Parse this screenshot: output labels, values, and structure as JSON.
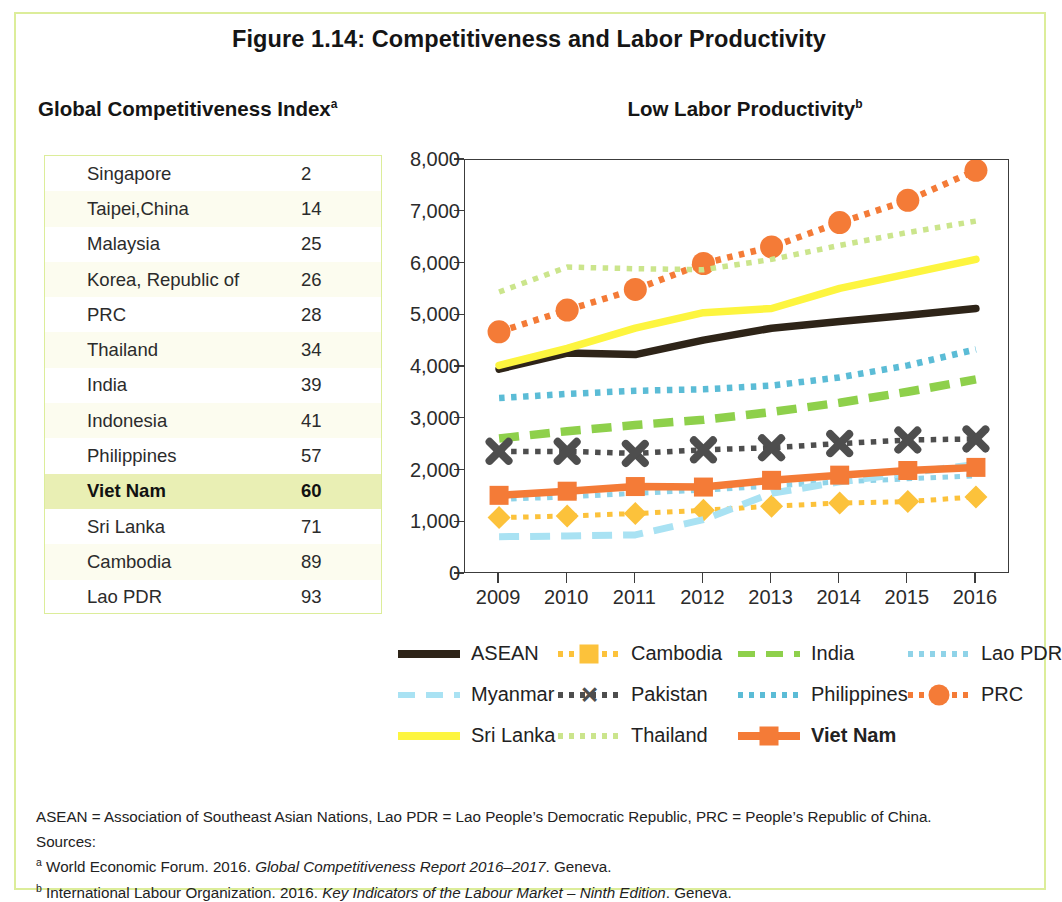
{
  "figure": {
    "title": "Figure 1.14:  Competitiveness and Labor Productivity",
    "left_panel_title": "Global Competitiveness Index",
    "left_panel_super": "a",
    "right_panel_title": "Low Labor Productivity",
    "right_panel_super": "b"
  },
  "gci_table": {
    "rows": [
      {
        "name": "Singapore",
        "rank": "2",
        "highlight": false
      },
      {
        "name": "Taipei,China",
        "rank": "14",
        "highlight": false
      },
      {
        "name": "Malaysia",
        "rank": "25",
        "highlight": false
      },
      {
        "name": "Korea, Republic of",
        "rank": "26",
        "highlight": false
      },
      {
        "name": "PRC",
        "rank": "28",
        "highlight": false
      },
      {
        "name": "Thailand",
        "rank": "34",
        "highlight": false
      },
      {
        "name": "India",
        "rank": "39",
        "highlight": false
      },
      {
        "name": "Indonesia",
        "rank": "41",
        "highlight": false
      },
      {
        "name": "Philippines",
        "rank": "57",
        "highlight": false
      },
      {
        "name": "Viet Nam",
        "rank": "60",
        "highlight": true
      },
      {
        "name": "Sri Lanka",
        "rank": "71",
        "highlight": false
      },
      {
        "name": "Cambodia",
        "rank": "89",
        "highlight": false
      },
      {
        "name": "Lao PDR",
        "rank": "93",
        "highlight": false
      }
    ]
  },
  "legend": {
    "rows": [
      [
        {
          "label": "ASEAN",
          "key": "asean",
          "bold": false
        },
        {
          "label": "Cambodia",
          "key": "cambodia",
          "bold": false
        },
        {
          "label": "India",
          "key": "india",
          "bold": false
        },
        {
          "label": "Lao PDR",
          "key": "lao",
          "bold": false
        }
      ],
      [
        {
          "label": "Myanmar",
          "key": "myanmar",
          "bold": false
        },
        {
          "label": "Pakistan",
          "key": "pakistan",
          "bold": false
        },
        {
          "label": "Philippines",
          "key": "philippines",
          "bold": false
        },
        {
          "label": "PRC",
          "key": "prc",
          "bold": false
        }
      ],
      [
        {
          "label": "Sri Lanka",
          "key": "srilanka",
          "bold": false
        },
        {
          "label": "Thailand",
          "key": "thailand",
          "bold": false
        },
        {
          "label": "Viet Nam",
          "key": "vietnam",
          "bold": true
        }
      ]
    ]
  },
  "notes": {
    "abbrev": "ASEAN = Association of Southeast Asian Nations, Lao PDR = Lao People’s Democratic Republic, PRC = People’s Republic of China.",
    "sources_label": "Sources:",
    "source_a_sup": "a",
    "source_a_pre": "World Economic Forum. 2016. ",
    "source_a_italic": "Global Competitiveness Report 2016–2017",
    "source_a_post": ". Geneva.",
    "source_b_sup": "b",
    "source_b_pre": "International Labour Organization. 2016. ",
    "source_b_italic": "Key Indicators of the Labour Market – Ninth Edition",
    "source_b_post": ". Geneva."
  },
  "colors": {
    "asean": "#2e2418",
    "cambodia": "#fcc23b",
    "india": "#8ed04b",
    "lao": "#8fd3e8",
    "myanmar": "#a9e2f3",
    "pakistan": "#4e4e4e",
    "philippines": "#5bbcd6",
    "prc": "#f47b37",
    "srilanka": "#fdf53f",
    "thailand": "#cbe58c",
    "vietnam": "#f47b37",
    "frame": "#dced9a",
    "row_highlight": "#e9efb4"
  },
  "chart_data": {
    "type": "line",
    "title": "Low Labor Productivity",
    "xlabel": "",
    "ylabel": "",
    "x": [
      2009,
      2010,
      2011,
      2012,
      2013,
      2014,
      2015,
      2016
    ],
    "xtick_labels": [
      "2009",
      "2010",
      "2011",
      "2012",
      "2013",
      "2014",
      "2015",
      "2016"
    ],
    "ytick_labels": [
      "0",
      "1,000",
      "2,000",
      "3,000",
      "4,000",
      "5,000",
      "6,000",
      "7,000",
      "8,000"
    ],
    "ylim": [
      0,
      8000
    ],
    "ytick_step": 1000,
    "grid": false,
    "legend_position": "bottom",
    "series": [
      {
        "name": "ASEAN",
        "key": "asean",
        "style": "solid",
        "marker": "none",
        "values": [
          3960,
          4270,
          4240,
          4520,
          4750,
          4880,
          5000,
          5130
        ]
      },
      {
        "name": "Cambodia",
        "key": "cambodia",
        "style": "dotted",
        "marker": "diamond",
        "values": [
          1090,
          1120,
          1170,
          1230,
          1310,
          1370,
          1400,
          1490
        ]
      },
      {
        "name": "India",
        "key": "india",
        "style": "dashed",
        "marker": "none",
        "values": [
          2620,
          2760,
          2880,
          2980,
          3130,
          3310,
          3520,
          3760
        ]
      },
      {
        "name": "Lao PDR",
        "key": "lao",
        "style": "dotted",
        "marker": "none",
        "values": [
          1440,
          1490,
          1560,
          1620,
          1700,
          1780,
          1840,
          1900
        ]
      },
      {
        "name": "Myanmar",
        "key": "myanmar",
        "style": "dashed",
        "marker": "none",
        "values": [
          720,
          735,
          755,
          1050,
          1560,
          1780,
          1950,
          2120
        ]
      },
      {
        "name": "Pakistan",
        "key": "pakistan",
        "style": "dotted",
        "marker": "x",
        "values": [
          2370,
          2370,
          2330,
          2400,
          2440,
          2520,
          2590,
          2610
        ]
      },
      {
        "name": "Philippines",
        "key": "philippines",
        "style": "dotted",
        "marker": "none",
        "values": [
          3400,
          3480,
          3540,
          3570,
          3640,
          3800,
          4030,
          4340
        ]
      },
      {
        "name": "PRC",
        "key": "prc",
        "style": "dotted",
        "marker": "circle",
        "values": [
          4680,
          5100,
          5500,
          6000,
          6320,
          6790,
          7220,
          7800
        ]
      },
      {
        "name": "Sri Lanka",
        "key": "srilanka",
        "style": "solid",
        "marker": "none",
        "values": [
          4030,
          4360,
          4750,
          5050,
          5130,
          5520,
          5800,
          6080
        ]
      },
      {
        "name": "Thailand",
        "key": "thailand",
        "style": "dotted",
        "marker": "none",
        "values": [
          5450,
          5930,
          5900,
          5880,
          6080,
          6350,
          6600,
          6820
        ]
      },
      {
        "name": "Viet Nam",
        "key": "vietnam",
        "style": "solid",
        "marker": "square",
        "values": [
          1520,
          1600,
          1690,
          1680,
          1810,
          1910,
          2000,
          2060
        ]
      }
    ]
  }
}
